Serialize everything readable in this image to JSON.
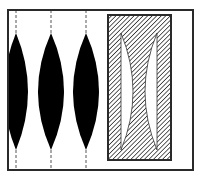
{
  "figure": {
    "colors": {
      "background": "#ffffff",
      "frame": "#2a2a2a",
      "lens_fill": "#000000",
      "hatch_line": "#1a1a1a",
      "hatch_bg": "#ffffff",
      "dash": "#555555"
    },
    "frame": {
      "x": 8,
      "y": 10,
      "width": 185,
      "height": 160
    },
    "dashed_lines": [
      16,
      51,
      86
    ],
    "convex_lenses": [
      {
        "cx": 16,
        "top": 33,
        "bottom": 150,
        "half_width": 12
      },
      {
        "cx": 51,
        "top": 33,
        "bottom": 150,
        "half_width": 13
      },
      {
        "cx": 86,
        "top": 33,
        "bottom": 150,
        "half_width": 13
      }
    ],
    "hatched_block": {
      "x": 108,
      "y": 15,
      "width": 63,
      "height": 145
    },
    "crescent_gaps": [
      {
        "side": "left",
        "edge_x": 121,
        "bulge_x": 133,
        "top": 33,
        "bottom": 150
      },
      {
        "side": "right",
        "edge_x": 157,
        "bulge_x": 145,
        "top": 33,
        "bottom": 150
      }
    ]
  }
}
